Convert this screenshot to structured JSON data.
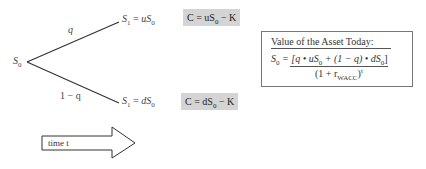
{
  "tree": {
    "root_label": "S",
    "root_sub": "0",
    "up_branch": {
      "probability": "q",
      "node_lhs": "S",
      "node_lhs_sub": "1",
      "node_eq": " = ",
      "node_rhs": "uS",
      "node_rhs_sub": "0",
      "payoff_pre": "C = uS",
      "payoff_sub": "0",
      "payoff_post": " − K"
    },
    "down_branch": {
      "probability": "1 − q",
      "node_lhs": "S",
      "node_lhs_sub": "1",
      "node_eq": " = ",
      "node_rhs": "dS",
      "node_rhs_sub": "0",
      "payoff_pre": "C = dS",
      "payoff_sub": "0",
      "payoff_post": " − K"
    }
  },
  "value_box": {
    "title": "Value of the Asset Today:",
    "lhs": "S",
    "lhs_sub": "0",
    "numerator_a": " = [q • uS",
    "numerator_sub1": "0",
    "numerator_b": " + (1 − q) • dS",
    "numerator_sub2": "0",
    "numerator_c": "]",
    "denominator_a": "(1 + r",
    "denominator_sub": "WACC",
    "denominator_b": ")",
    "denominator_sup": "t"
  },
  "time_arrow": {
    "label": "time  t"
  },
  "colors": {
    "payoff_box_bg": "#d4d4d4",
    "line": "#333333",
    "box_border": "#777777"
  }
}
